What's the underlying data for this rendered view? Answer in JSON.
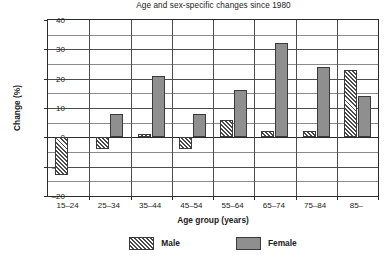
{
  "chart_data": {
    "type": "bar",
    "title": "Age and sex-specific changes since 1980",
    "xlabel": "Age group (years)",
    "ylabel": "Change (%)",
    "categories": [
      "15–24",
      "25–34",
      "35–44",
      "45–54",
      "55–64",
      "65–74",
      "75–84",
      "85–"
    ],
    "series": [
      {
        "name": "Male",
        "color": "#ffffff",
        "pattern": "diagonal-hatch",
        "values": [
          -13,
          -4,
          1,
          -4,
          6,
          2,
          2,
          23
        ]
      },
      {
        "name": "Female",
        "color": "#8f8f8f",
        "pattern": "solid",
        "values": [
          0,
          8,
          21,
          8,
          16,
          32,
          24,
          14
        ]
      }
    ],
    "ylim": [
      -20,
      40
    ],
    "ymajor_ticks": [
      40,
      30,
      20,
      10,
      0,
      -10,
      -20
    ],
    "yminor_ticks": [
      35,
      25,
      15,
      5,
      -5,
      -15
    ],
    "ytick_labels": [
      "40",
      "30",
      "20",
      "10",
      "0",
      "–10",
      "–20"
    ],
    "grid": true,
    "grid_axis": "both",
    "legend_position": "bottom"
  }
}
